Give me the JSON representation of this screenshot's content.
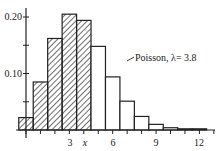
{
  "chart_data": {
    "type": "bar",
    "title": "",
    "xlabel": "x",
    "ylabel": "",
    "categories": [
      0,
      1,
      2,
      3,
      4,
      5,
      6,
      7,
      8,
      9,
      10,
      11,
      12
    ],
    "series": [
      {
        "name": "Poisson, λ= 3.8",
        "values": [
          0.022,
          0.085,
          0.162,
          0.205,
          0.194,
          0.148,
          0.094,
          0.051,
          0.024,
          0.01,
          0.004,
          0.0014,
          0.0004
        ],
        "hatched_upto_index": 4
      }
    ],
    "ylim": [
      0,
      0.22
    ],
    "yticks": [
      "0.10",
      "0.20"
    ],
    "xticks": [
      "3",
      "6",
      "9",
      "12"
    ],
    "annotation": "Poisson, λ= 3.8",
    "grid": false
  },
  "labels": {
    "y010": "0.10",
    "y020": "0.20",
    "x3": "3",
    "x6": "6",
    "x9": "9",
    "x12": "12",
    "xvar": "x",
    "annotation": "Poisson, λ= 3.8"
  }
}
